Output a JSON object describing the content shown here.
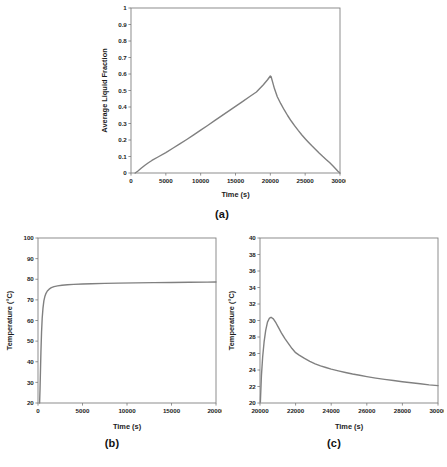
{
  "figure": {
    "background": "#ffffff",
    "line_color": "#808080",
    "frame_color": "#808080",
    "text_color": "#1c1c1c"
  },
  "panels": [
    {
      "id": "a",
      "caption": "(a)",
      "xlabel": "Time (s)",
      "ylabel": "Average Liquid Fraction"
    },
    {
      "id": "b",
      "caption": "(b)",
      "xlabel": "Time (s)",
      "ylabel": "Temperature (°C)"
    },
    {
      "id": "c",
      "caption": "(c)",
      "xlabel": "Time (s)",
      "ylabel": "Temperature (°C)"
    }
  ],
  "chart_data": [
    {
      "type": "line",
      "panel": "a",
      "title": "(a)",
      "xlabel": "Time (s)",
      "ylabel": "Average Liquid Fraction",
      "xlim": [
        0,
        30000
      ],
      "ylim": [
        0,
        1
      ],
      "xticks": [
        0,
        5000,
        10000,
        15000,
        20000,
        25000,
        30000
      ],
      "xticklabels": [
        "0",
        "5000",
        "10000",
        "15000",
        "20000",
        "25000",
        "30000"
      ],
      "yticks": [
        0,
        0.1,
        0.2,
        0.3,
        0.4,
        0.5,
        0.6,
        0.7,
        0.8,
        0.9,
        1
      ],
      "yticklabels": [
        "0",
        "0.1",
        "0.2",
        "0.3",
        "0.4",
        "0.5",
        "0.6",
        "0.7",
        "0.8",
        "0.9",
        "1"
      ],
      "grid": false,
      "legend": null,
      "color": "#808080",
      "series": [
        {
          "name": "Average liquid fraction",
          "x": [
            600,
            1000,
            1500,
            2000,
            2500,
            3000,
            4000,
            5000,
            6000,
            7000,
            8000,
            9000,
            10000,
            11000,
            12000,
            13000,
            14000,
            15000,
            16000,
            17000,
            18000,
            19000,
            19600,
            20000,
            20100,
            20300,
            20600,
            21000,
            21500,
            22000,
            22500,
            23000,
            23500,
            24000,
            24500,
            25000,
            25500,
            26000,
            26500,
            27000,
            27500,
            28000,
            28500,
            29000,
            29400,
            29700,
            30000
          ],
          "y": [
            0.0,
            0.012,
            0.03,
            0.047,
            0.062,
            0.076,
            0.1,
            0.124,
            0.15,
            0.176,
            0.203,
            0.231,
            0.26,
            0.288,
            0.317,
            0.346,
            0.375,
            0.404,
            0.433,
            0.462,
            0.491,
            0.535,
            0.565,
            0.588,
            0.585,
            0.555,
            0.51,
            0.462,
            0.42,
            0.382,
            0.347,
            0.315,
            0.286,
            0.258,
            0.232,
            0.208,
            0.185,
            0.163,
            0.142,
            0.121,
            0.101,
            0.082,
            0.063,
            0.042,
            0.024,
            0.011,
            0.0
          ]
        }
      ]
    },
    {
      "type": "line",
      "panel": "b",
      "title": "(b)",
      "xlabel": "Time (s)",
      "ylabel": "Temperature (°C)",
      "xlim": [
        0,
        20000
      ],
      "ylim": [
        20,
        100
      ],
      "xticks": [
        0,
        5000,
        10000,
        15000,
        20000
      ],
      "xticklabels": [
        "0",
        "5000",
        "10000",
        "15000",
        "20000"
      ],
      "yticks": [
        20,
        30,
        40,
        50,
        60,
        70,
        80,
        90,
        100
      ],
      "yticklabels": [
        "20",
        "30",
        "40",
        "50",
        "60",
        "70",
        "80",
        "90",
        "100"
      ],
      "grid": false,
      "legend": null,
      "color": "#808080",
      "series": [
        {
          "name": "Temperature",
          "x": [
            180,
            230,
            280,
            330,
            400,
            470,
            560,
            660,
            780,
            900,
            1050,
            1250,
            1500,
            1800,
            2200,
            2700,
            3300,
            4000,
            5000,
            6000,
            7500,
            9000,
            11000,
            13000,
            15000,
            17000,
            19000,
            20000
          ],
          "y": [
            20.0,
            27.0,
            36.0,
            45.0,
            54.5,
            61.0,
            66.0,
            69.5,
            71.8,
            73.2,
            74.3,
            75.2,
            75.9,
            76.4,
            76.8,
            77.1,
            77.35,
            77.5,
            77.7,
            77.85,
            78.0,
            78.1,
            78.25,
            78.35,
            78.45,
            78.55,
            78.6,
            78.65
          ]
        }
      ]
    },
    {
      "type": "line",
      "panel": "c",
      "title": "(c)",
      "xlabel": "Time (s)",
      "ylabel": "Temperature (°C)",
      "xlim": [
        20000,
        30000
      ],
      "ylim": [
        20,
        40
      ],
      "xticks": [
        20000,
        22000,
        24000,
        26000,
        28000,
        30000
      ],
      "xticklabels": [
        "20000",
        "22000",
        "24000",
        "26000",
        "28000",
        "30000"
      ],
      "yticks": [
        20,
        22,
        24,
        26,
        28,
        30,
        32,
        34,
        36,
        38,
        40
      ],
      "yticklabels": [
        "20",
        "22",
        "24",
        "26",
        "28",
        "30",
        "32",
        "34",
        "36",
        "38",
        "40"
      ],
      "grid": false,
      "legend": null,
      "color": "#808080",
      "series": [
        {
          "name": "Temperature",
          "x": [
            20020,
            20080,
            20150,
            20230,
            20320,
            20420,
            20520,
            20620,
            20750,
            20900,
            21050,
            21200,
            21400,
            21600,
            21800,
            22000,
            22200,
            22500,
            22800,
            23100,
            23400,
            23700,
            24000,
            24400,
            24800,
            25200,
            25600,
            26000,
            26500,
            27000,
            27500,
            28000,
            28500,
            29000,
            29500,
            30000
          ],
          "y": [
            20.1,
            23.3,
            25.6,
            27.4,
            28.8,
            29.8,
            30.25,
            30.4,
            30.2,
            29.7,
            29.1,
            28.5,
            27.8,
            27.2,
            26.6,
            26.1,
            25.8,
            25.4,
            25.05,
            24.75,
            24.5,
            24.3,
            24.1,
            23.9,
            23.7,
            23.52,
            23.36,
            23.2,
            23.02,
            22.86,
            22.72,
            22.58,
            22.45,
            22.33,
            22.2,
            22.1
          ]
        }
      ]
    }
  ]
}
